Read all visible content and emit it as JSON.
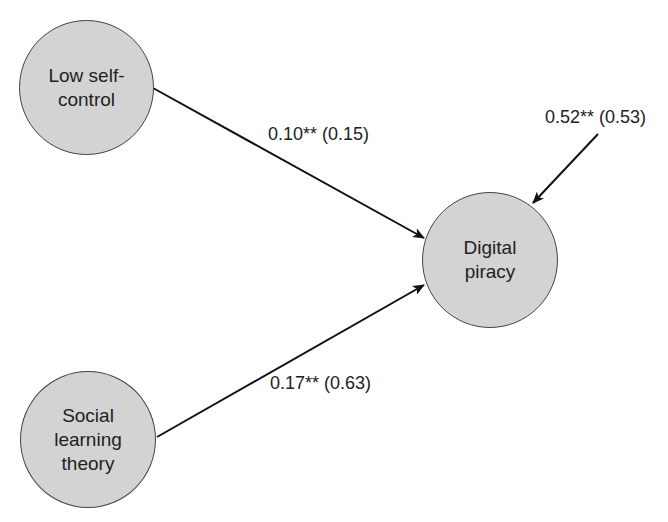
{
  "diagram": {
    "type": "path-model",
    "nodes": [
      {
        "id": "low_self_control",
        "lines": [
          "Low self-",
          "control"
        ]
      },
      {
        "id": "social_learning_theory",
        "lines": [
          "Social",
          "learning",
          "theory"
        ]
      },
      {
        "id": "digital_piracy",
        "lines": [
          "Digital",
          "piracy"
        ]
      }
    ],
    "edges": [
      {
        "from": "low_self_control",
        "to": "digital_piracy",
        "label": "0.10** (0.15)"
      },
      {
        "from": "social_learning_theory",
        "to": "digital_piracy",
        "label": "0.17** (0.63)"
      },
      {
        "from": "error",
        "to": "digital_piracy",
        "label": "0.52** (0.53)"
      }
    ],
    "colors": {
      "node_fill": "#d3d3d3",
      "node_stroke": "#444444",
      "edge": "#111111"
    }
  }
}
